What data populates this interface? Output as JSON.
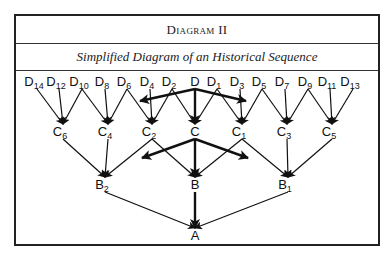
{
  "header": {
    "title": "Diagram II",
    "subtitle": "Simplified Diagram of an Historical Sequence"
  },
  "colors": {
    "ink": "#111111",
    "border": "#222222",
    "background": "#ffffff"
  },
  "nodes": {
    "D_row": [
      {
        "id": "D14",
        "base": "D",
        "sub": "14",
        "x": 37
      },
      {
        "id": "D12",
        "base": "D",
        "sub": "12",
        "x": 59
      },
      {
        "id": "D10",
        "base": "D",
        "sub": "10",
        "x": 82
      },
      {
        "id": "D8",
        "base": "D",
        "sub": "8",
        "x": 105
      },
      {
        "id": "D6",
        "base": "D",
        "sub": "6",
        "x": 127
      },
      {
        "id": "D4",
        "base": "D",
        "sub": "4",
        "x": 150
      },
      {
        "id": "D2",
        "base": "D",
        "sub": "2",
        "x": 172
      },
      {
        "id": "D",
        "base": "D",
        "sub": "",
        "x": 195
      },
      {
        "id": "D1",
        "base": "D",
        "sub": "1",
        "x": 217
      },
      {
        "id": "D3",
        "base": "D",
        "sub": "3",
        "x": 240
      },
      {
        "id": "D5",
        "base": "D",
        "sub": "5",
        "x": 262
      },
      {
        "id": "D7",
        "base": "D",
        "sub": "7",
        "x": 285
      },
      {
        "id": "D9",
        "base": "D",
        "sub": "9",
        "x": 308
      },
      {
        "id": "D11",
        "base": "D",
        "sub": "11",
        "x": 330
      },
      {
        "id": "D13",
        "base": "D",
        "sub": "13",
        "x": 353
      }
    ],
    "C_row": [
      {
        "id": "C6",
        "base": "C",
        "sub": "6",
        "x": 63
      },
      {
        "id": "C4",
        "base": "C",
        "sub": "4",
        "x": 108
      },
      {
        "id": "C2",
        "base": "C",
        "sub": "2",
        "x": 152
      },
      {
        "id": "C",
        "base": "C",
        "sub": "",
        "x": 195
      },
      {
        "id": "C1",
        "base": "C",
        "sub": "1",
        "x": 242
      },
      {
        "id": "C3",
        "base": "C",
        "sub": "3",
        "x": 287
      },
      {
        "id": "C5",
        "base": "C",
        "sub": "5",
        "x": 332
      }
    ],
    "B_row": [
      {
        "id": "B2",
        "base": "B",
        "sub": "2",
        "x": 105
      },
      {
        "id": "B",
        "base": "B",
        "sub": "",
        "x": 195
      },
      {
        "id": "B1",
        "base": "B",
        "sub": "1",
        "x": 288
      }
    ],
    "A_row": [
      {
        "id": "A",
        "base": "A",
        "sub": "",
        "x": 195
      }
    ]
  },
  "edges": [
    [
      "D14",
      "C6"
    ],
    [
      "D12",
      "C6"
    ],
    [
      "D10",
      "C6"
    ],
    [
      "D10",
      "C4"
    ],
    [
      "D8",
      "C4"
    ],
    [
      "D6",
      "C4"
    ],
    [
      "D6",
      "C2"
    ],
    [
      "D4",
      "C2"
    ],
    [
      "D2",
      "C2"
    ],
    [
      "D2",
      "C"
    ],
    [
      "D",
      "C"
    ],
    [
      "D1",
      "C"
    ],
    [
      "D1",
      "C1"
    ],
    [
      "D3",
      "C1"
    ],
    [
      "D5",
      "C1"
    ],
    [
      "D5",
      "C3"
    ],
    [
      "D7",
      "C3"
    ],
    [
      "D9",
      "C3"
    ],
    [
      "D9",
      "C5"
    ],
    [
      "D11",
      "C5"
    ],
    [
      "D13",
      "C5"
    ],
    [
      "C6",
      "B2"
    ],
    [
      "C4",
      "B2"
    ],
    [
      "C2",
      "B2"
    ],
    [
      "C2",
      "B"
    ],
    [
      "C",
      "B"
    ],
    [
      "C1",
      "B"
    ],
    [
      "C1",
      "B1"
    ],
    [
      "C3",
      "B1"
    ],
    [
      "C5",
      "B1"
    ],
    [
      "B2",
      "A"
    ],
    [
      "B",
      "A"
    ],
    [
      "B1",
      "A"
    ]
  ],
  "thick_edges": [
    [
      "D",
      "C"
    ],
    [
      "C",
      "B"
    ],
    [
      "B",
      "A"
    ]
  ],
  "branch_arrows": [
    {
      "from": "D",
      "to_xy": [
        140,
        101
      ]
    },
    {
      "from": "D",
      "to_xy": [
        246,
        101
      ]
    },
    {
      "from": "C",
      "to_xy": [
        142,
        158
      ]
    },
    {
      "from": "C",
      "to_xy": [
        248,
        158
      ]
    }
  ]
}
